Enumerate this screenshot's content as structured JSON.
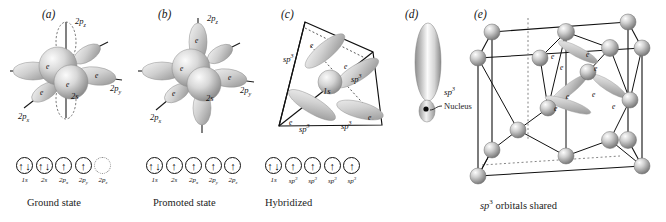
{
  "figure": {
    "background": "#ffffff",
    "ink": "#111111"
  },
  "panels": [
    {
      "id": "a",
      "letter": "(a)",
      "caption": "Ground state",
      "orbital_labels": [
        "2p",
        "2p",
        "2p",
        "2s"
      ],
      "lobe_labels": [
        {
          "text": "2p",
          "sub": "z"
        },
        {
          "text": "2p",
          "sub": "y"
        },
        {
          "text": "2p",
          "sub": "x"
        },
        {
          "text": "2s",
          "sub": ""
        }
      ],
      "electron_marks": [
        "e",
        "e",
        "e",
        "e"
      ],
      "boxes": [
        {
          "label": "1s",
          "sup": "",
          "occupancy": "pair",
          "empty": false
        },
        {
          "label": "2s",
          "sup": "",
          "occupancy": "pair",
          "empty": false
        },
        {
          "label": "2p",
          "sub": "x",
          "occupancy": "single",
          "empty": false
        },
        {
          "label": "2p",
          "sub": "y",
          "occupancy": "single",
          "empty": false
        },
        {
          "label": "2p",
          "sub": "z",
          "occupancy": "none",
          "empty": true
        }
      ]
    },
    {
      "id": "b",
      "letter": "(b)",
      "caption": "Promoted state",
      "lobe_labels": [
        {
          "text": "2p",
          "sub": "z"
        },
        {
          "text": "2p",
          "sub": "y"
        },
        {
          "text": "2p",
          "sub": "x"
        },
        {
          "text": "2s",
          "sub": ""
        }
      ],
      "electron_marks": [
        "e",
        "e",
        "e",
        "e"
      ],
      "boxes": [
        {
          "label": "1s",
          "sup": "",
          "occupancy": "pair",
          "empty": false
        },
        {
          "label": "2s",
          "sup": "",
          "occupancy": "single",
          "empty": false
        },
        {
          "label": "2p",
          "sub": "x",
          "occupancy": "single",
          "empty": false
        },
        {
          "label": "2p",
          "sub": "y",
          "occupancy": "single",
          "empty": false
        },
        {
          "label": "2p",
          "sub": "z",
          "occupancy": "single",
          "empty": false
        }
      ]
    },
    {
      "id": "c",
      "letter": "(c)",
      "caption": "Hybridized",
      "center_label": "1s",
      "lobe_labels": [
        "sp3",
        "sp3",
        "sp3",
        "sp3"
      ],
      "electron_marks": [
        "e",
        "e",
        "e",
        "e"
      ],
      "boxes": [
        {
          "label": "1s",
          "sup": "",
          "occupancy": "pair",
          "empty": false
        },
        {
          "label": "sp",
          "sup": "3",
          "occupancy": "single",
          "empty": false
        },
        {
          "label": "sp",
          "sup": "3",
          "occupancy": "single",
          "empty": false
        },
        {
          "label": "sp",
          "sup": "3",
          "occupancy": "single",
          "empty": false
        },
        {
          "label": "sp",
          "sup": "3",
          "occupancy": "single",
          "empty": false
        }
      ]
    },
    {
      "id": "d",
      "letter": "(d)",
      "caption": "",
      "orbital_label": "sp3",
      "nucleus_label": "Nucleus"
    },
    {
      "id": "e",
      "letter": "(e)",
      "caption": "sp3 orbitals shared",
      "electron_marks": [
        "e",
        "e",
        "e",
        "e",
        "e",
        "e",
        "e",
        "e"
      ],
      "structure": "diamond cubic lattice"
    }
  ],
  "glyphs": {
    "arrow_up": "↑",
    "arrow_down": "↓",
    "sup_three": "3"
  }
}
